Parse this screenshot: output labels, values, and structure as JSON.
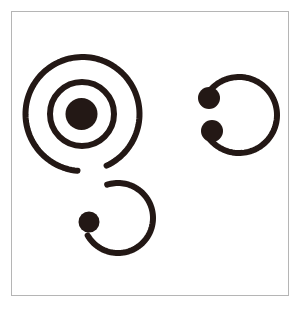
{
  "canvas": {
    "width": 301,
    "height": 309,
    "background_color": "#ffffff"
  },
  "frame": {
    "name": "figure-border",
    "x": 11,
    "y": 11,
    "width": 278,
    "height": 285,
    "stroke_color": "#b5b5b5",
    "stroke_width": 1,
    "fill_color": "#ffffff"
  },
  "ink": {
    "color": "#231815",
    "stroke_width": 6
  },
  "figures": [
    {
      "id": "left-spiral-figure",
      "label": "large double spiral with center dot and descending tail",
      "parts": [
        {
          "id": "outer-spiral-arc",
          "label": "outer spiral arc",
          "type": "arc",
          "cx": 82.5,
          "cy": 114,
          "r": 57,
          "start_angle_deg": 95,
          "sweep_deg": 330
        },
        {
          "id": "spiral-transition-arc",
          "label": "descending tail connecting outer spiral to lower loop",
          "type": "arc",
          "cx": 118,
          "cy": 218,
          "r": 35,
          "start_angle_deg": 252,
          "sweep_deg": 258
        },
        {
          "id": "middle-ring",
          "label": "inner ring of spiral",
          "type": "circle",
          "cx": 82,
          "cy": 114,
          "r": 32
        },
        {
          "id": "center-dot",
          "label": "filled center dot",
          "type": "dot",
          "cx": 81.5,
          "cy": 114,
          "r": 16
        },
        {
          "id": "lower-tail-dot",
          "label": "filled dot at end of lower spiral tail",
          "type": "dot",
          "cx": 89,
          "cy": 222,
          "r": 10.5
        }
      ]
    },
    {
      "id": "right-c-figure",
      "label": "open C ring with two filled terminal dots",
      "parts": [
        {
          "id": "c-ring-arc",
          "label": "C shaped open ring",
          "type": "arc",
          "cx": 239,
          "cy": 115,
          "r": 38,
          "start_angle_deg": 199,
          "sweep_deg": 300
        },
        {
          "id": "c-top-dot",
          "label": "filled dot at upper terminal of C",
          "type": "dot",
          "cx": 209,
          "cy": 98,
          "r": 11
        },
        {
          "id": "c-bottom-dot",
          "label": "filled dot at lower terminal of C",
          "type": "dot",
          "cx": 212,
          "cy": 131,
          "r": 11
        }
      ]
    }
  ],
  "caption": ""
}
